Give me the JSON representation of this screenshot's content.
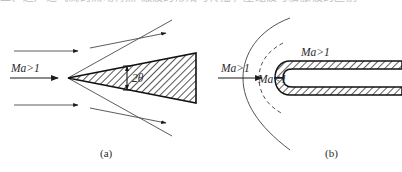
{
  "figure": {
    "top_cut_text": "二、超声速气流的流动特点  激波的形成与传播，压缩波与膨胀波的区别",
    "captions": {
      "a": "(a)",
      "b": "(b)"
    }
  },
  "panel_a": {
    "name": "wedge-attached-oblique-shock",
    "inflow_label": "Ma>1",
    "angle_label": "2θ",
    "apex": {
      "x": 68,
      "y": 78
    }
  },
  "panel_b": {
    "name": "blunt-body-detached-bow-shock",
    "inflow_label": "Ma>1",
    "subsonic_label": "Ma<1",
    "supersonic_label": "Ma>1"
  },
  "colors": {
    "line": "#1a1a1a",
    "thin_line": "#4a4a4a",
    "hatch": "#2a2a2a",
    "text": "#2b2b2b",
    "background": "#ffffff"
  }
}
